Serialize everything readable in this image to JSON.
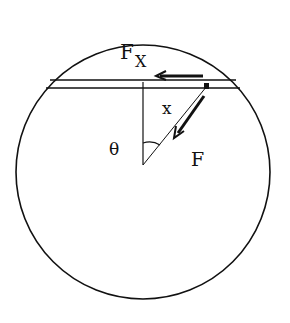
{
  "diagram": {
    "type": "physics-free-body",
    "labels": {
      "force_x_main": "F",
      "force_x_sub": "X",
      "displacement": "x",
      "angle": "θ",
      "force": "F"
    },
    "colors": {
      "stroke": "#111111",
      "background": "#ffffff"
    }
  }
}
